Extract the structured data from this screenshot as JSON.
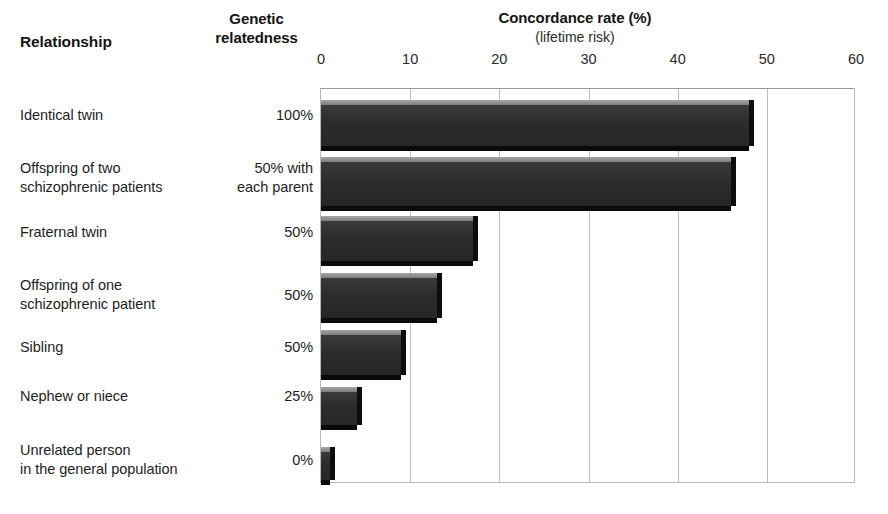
{
  "headers": {
    "relationship": "Relationship",
    "genetic_relatedness": "Genetic\nrelatedness",
    "genetic_line1": "Genetic",
    "genetic_line2": "relatedness",
    "concordance_title": "Concordance rate (%)",
    "concordance_subtitle": "(lifetime risk)"
  },
  "chart_data": {
    "type": "bar",
    "orientation": "horizontal",
    "title": "Concordance rate (%)",
    "subtitle": "(lifetime risk)",
    "xlabel": "Concordance rate (%)",
    "ylabel": "Relationship",
    "xlim": [
      0,
      60
    ],
    "xticks": [
      0,
      10,
      20,
      30,
      40,
      50,
      60
    ],
    "xtick_labels": [
      "0",
      "10",
      "20",
      "30",
      "40",
      "50",
      "60"
    ],
    "grid": true,
    "legend": null,
    "categories": [
      "Identical twin",
      "Offspring of two schizophrenic patients",
      "Fraternal twin",
      "Offspring of one schizophrenic patient",
      "Sibling",
      "Nephew or niece",
      "Unrelated person in the general population"
    ],
    "values": [
      48,
      46,
      17,
      13,
      9,
      4,
      1
    ],
    "genetic_relatedness": [
      "100%",
      "50% with each parent",
      "50%",
      "50%",
      "50%",
      "25%",
      "0%"
    ],
    "bar_color": "#2e2e2e"
  },
  "rows": [
    {
      "label_line1": "Identical twin",
      "label_line2": "",
      "genetic_line1": "100%",
      "genetic_line2": "",
      "value": 48
    },
    {
      "label_line1": "Offspring of two",
      "label_line2": "schizophrenic patients",
      "genetic_line1": "50% with",
      "genetic_line2": "each parent",
      "value": 46
    },
    {
      "label_line1": "Fraternal twin",
      "label_line2": "",
      "genetic_line1": "50%",
      "genetic_line2": "",
      "value": 17
    },
    {
      "label_line1": "Offspring of one",
      "label_line2": "schizophrenic patient",
      "genetic_line1": "50%",
      "genetic_line2": "",
      "value": 13
    },
    {
      "label_line1": "Sibling",
      "label_line2": "",
      "genetic_line1": "50%",
      "genetic_line2": "",
      "value": 9
    },
    {
      "label_line1": "Nephew or niece",
      "label_line2": "",
      "genetic_line1": "25%",
      "genetic_line2": "",
      "value": 4
    },
    {
      "label_line1": "Unrelated person",
      "label_line2": "in the general population",
      "genetic_line1": "0%",
      "genetic_line2": "",
      "value": 1
    }
  ],
  "axis": {
    "ticks": [
      {
        "label": "0",
        "value": 0
      },
      {
        "label": "10",
        "value": 10
      },
      {
        "label": "20",
        "value": 20
      },
      {
        "label": "30",
        "value": 30
      },
      {
        "label": "40",
        "value": 40
      },
      {
        "label": "50",
        "value": 50
      },
      {
        "label": "60",
        "value": 60
      }
    ]
  },
  "colors": {
    "bar_face": "#2e2e2e",
    "bar_top": "#8f8f8f",
    "bar_side": "#0d0d0d",
    "grid": "#bdbdbd",
    "frame": "#b9b9b9",
    "text": "#1e1e1e",
    "background": "#ffffff"
  }
}
